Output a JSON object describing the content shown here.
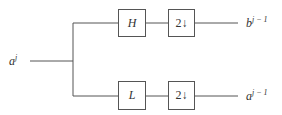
{
  "diagram": {
    "type": "filter-bank",
    "input": {
      "label": "a",
      "superscript": "j"
    },
    "branches": [
      {
        "name": "high",
        "filter": "H",
        "downsampler": "2↓",
        "output": {
          "label": "b",
          "superscript": "j − 1"
        }
      },
      {
        "name": "low",
        "filter": "L",
        "downsampler": "2↓",
        "output": {
          "label": "a",
          "superscript": "j − 1"
        }
      }
    ],
    "colors": {
      "line": "#555555",
      "text": "#333333",
      "background": "#ffffff"
    }
  }
}
